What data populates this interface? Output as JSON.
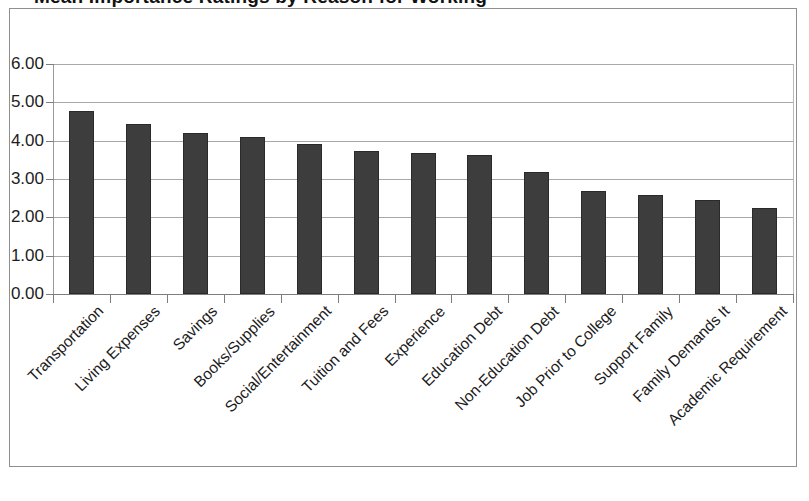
{
  "chart": {
    "title_partial": "Mean Importance Ratings by Reason for Working",
    "ylabel": "",
    "xlabel": ""
  },
  "chart_data": {
    "type": "bar",
    "title": "",
    "xlabel": "",
    "ylabel": "",
    "ylim": [
      0,
      6
    ],
    "ytick_labels": [
      "0.00",
      "1.00",
      "2.00",
      "3.00",
      "4.00",
      "5.00",
      "6.00"
    ],
    "ytick_values": [
      0,
      1,
      2,
      3,
      4,
      5,
      6
    ],
    "grid": true,
    "legend": false,
    "bar_color": "#3d3d3d",
    "categories": [
      "Transportation",
      "Living Expenses",
      "Savings",
      "Books/Supplies",
      "Social/Entertainment",
      "Tuition and Fees",
      "Experience",
      "Education Debt",
      "Non-Education Debt",
      "Job Prior to College",
      "Support Family",
      "Family Demands It",
      "Academic Requirement"
    ],
    "values": [
      4.78,
      4.44,
      4.2,
      4.09,
      3.92,
      3.74,
      3.67,
      3.63,
      3.18,
      2.68,
      2.57,
      2.44,
      2.24
    ]
  }
}
